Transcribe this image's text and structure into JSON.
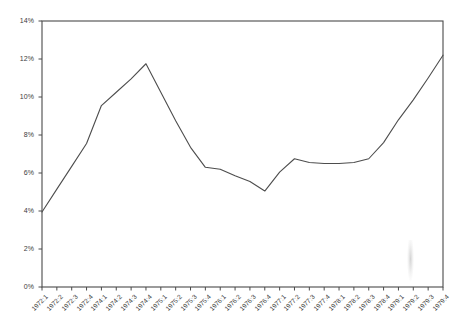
{
  "chart_data": {
    "type": "line",
    "title": "",
    "subtitle": "",
    "xlabel": "",
    "ylabel": "",
    "grid": false,
    "legend": null,
    "ylim": [
      0,
      14
    ],
    "ytick_values": [
      0,
      2,
      4,
      6,
      8,
      10,
      12,
      14
    ],
    "ytick_labels": [
      "0%",
      "2%",
      "4%",
      "6%",
      "8%",
      "10%",
      "12%",
      "14%"
    ],
    "categories": [
      "1972:1",
      "1972:2",
      "1972:3",
      "1972:4",
      "1974:1",
      "1974:2",
      "1974:3",
      "1974:4",
      "1975:1",
      "1975:2",
      "1975:3",
      "1975:4",
      "1976:1",
      "1976:2",
      "1976:3",
      "1976:4",
      "1977:1",
      "1977:2",
      "1977:3",
      "1977:4",
      "1978:1",
      "1978:2",
      "1978:3",
      "1978:4",
      "1979:1",
      "1979:2",
      "1979:3",
      "1979:4"
    ],
    "values": [
      3.95,
      5.15,
      6.35,
      7.55,
      9.55,
      10.25,
      10.95,
      11.75,
      10.25,
      8.75,
      7.35,
      6.3,
      6.2,
      5.85,
      5.55,
      5.05,
      6.05,
      6.75,
      6.55,
      6.5,
      6.5,
      6.55,
      6.75,
      7.6,
      8.8,
      9.85,
      11.0,
      12.2
    ],
    "line_color": "#4d4d4d",
    "axis_color": "#4a4a4a",
    "background_color": "#ffffff",
    "units": "percent"
  },
  "plot": {
    "left": 42,
    "right": 443,
    "top": 21,
    "bottom": 287
  }
}
